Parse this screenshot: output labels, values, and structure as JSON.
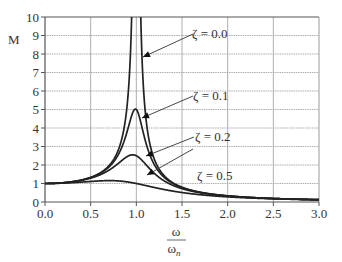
{
  "chart_data": {
    "type": "line",
    "title": "",
    "xlabel_num": "ω",
    "xlabel_den": "ωn",
    "xlabel_den_sub": "n",
    "ylabel": "M",
    "xlim": [
      0.0,
      3.0
    ],
    "ylim": [
      0,
      10
    ],
    "grid": true,
    "legend_position": "inline annotations",
    "x_ticks": [
      "0.0",
      "0.5",
      "1.0",
      "1.5",
      "2.0",
      "2.5",
      "3.0"
    ],
    "y_ticks": [
      "0",
      "1",
      "2",
      "3",
      "4",
      "5",
      "6",
      "7",
      "8",
      "9",
      "10"
    ],
    "x": [
      0.0,
      0.5,
      0.8,
      0.9,
      0.95,
      1.0,
      1.05,
      1.1,
      1.2,
      1.5,
      2.0,
      2.5,
      3.0
    ],
    "series": [
      {
        "name": "ζ = 0.0",
        "zeta": 0.0,
        "values": [
          1.0,
          1.33,
          2.78,
          5.26,
          10.0,
          10.0,
          10.0,
          4.76,
          2.27,
          0.8,
          0.33,
          0.19,
          0.125
        ]
      },
      {
        "name": "ζ = 0.1",
        "zeta": 0.1,
        "values": [
          1.0,
          1.32,
          2.63,
          4.16,
          4.99,
          5.0,
          4.6,
          3.59,
          2.04,
          0.79,
          0.33,
          0.19,
          0.125
        ]
      },
      {
        "name": "ζ = 0.2",
        "zeta": 0.2,
        "values": [
          1.0,
          1.29,
          2.27,
          2.72,
          2.69,
          2.5,
          2.23,
          1.95,
          1.55,
          0.76,
          0.32,
          0.19,
          0.12
        ]
      },
      {
        "name": "ζ = 0.5",
        "zeta": 0.5,
        "values": [
          1.0,
          1.11,
          1.28,
          1.29,
          1.21,
          1.0,
          0.93,
          0.86,
          0.73,
          0.55,
          0.28,
          0.17,
          0.12
        ]
      }
    ],
    "annotations": [
      {
        "text": "ζ = 0.0",
        "zeta": 0.0
      },
      {
        "text": "ζ = 0.1",
        "zeta": 0.1
      },
      {
        "text": "ζ = 0.2",
        "zeta": 0.2
      },
      {
        "text": "ζ = 0.5",
        "zeta": 0.5
      }
    ]
  },
  "colors": {
    "curve": "#222222",
    "grid": "#9a9a9a",
    "axis": "#555555",
    "text": "#333333"
  }
}
